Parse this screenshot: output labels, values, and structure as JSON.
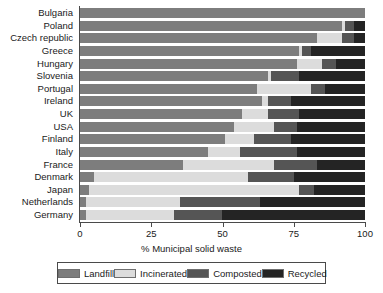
{
  "chart_data": {
    "type": "bar",
    "orientation": "horizontal",
    "stacked": true,
    "title": "",
    "xlabel": "% Municipal solid waste",
    "ylabel": "",
    "xlim": [
      0,
      100
    ],
    "xticks": [
      0,
      25,
      50,
      75,
      100
    ],
    "xtick_labels": [
      "0",
      "25",
      "50",
      "75",
      "100"
    ],
    "grid": false,
    "legend_position": "bottom",
    "categories": [
      "Bulgaria",
      "Poland",
      "Czech republic",
      "Greece",
      "Hungary",
      "Slovenia",
      "Portugal",
      "Ireland",
      "UK",
      "USA",
      "Finland",
      "Italy",
      "France",
      "Denmark",
      "Japan",
      "Netherlands",
      "Germany"
    ],
    "series": [
      {
        "name": "Landfill",
        "color": "#7d7d7d",
        "values": [
          100,
          92,
          83,
          77,
          76,
          66,
          62,
          64,
          57,
          54,
          51,
          45,
          36,
          5,
          3,
          2,
          2
        ]
      },
      {
        "name": "Incinerated",
        "color": "#dcdcdc",
        "values": [
          0,
          1,
          9,
          1,
          9,
          1,
          19,
          2,
          9,
          14,
          10,
          11,
          32,
          54,
          74,
          33,
          31
        ]
      },
      {
        "name": "Composted",
        "color": "#555555",
        "values": [
          0,
          3,
          4,
          3,
          5,
          10,
          5,
          8,
          11,
          8,
          13,
          20,
          15,
          16,
          5,
          28,
          17
        ]
      },
      {
        "name": "Recycled",
        "color": "#242424",
        "values": [
          0,
          4,
          4,
          19,
          10,
          23,
          14,
          26,
          23,
          24,
          26,
          24,
          17,
          25,
          18,
          37,
          50
        ]
      }
    ]
  },
  "legend": {
    "items": [
      {
        "label": "Landfill",
        "color": "#7d7d7d"
      },
      {
        "label": "Incinerated",
        "color": "#dcdcdc"
      },
      {
        "label": "Composted",
        "color": "#555555"
      },
      {
        "label": "Recycled",
        "color": "#242424"
      }
    ]
  }
}
